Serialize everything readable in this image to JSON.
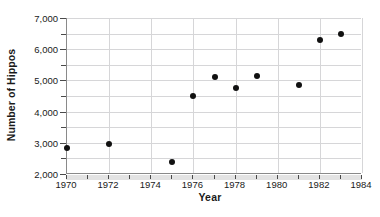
{
  "chart_data": {
    "type": "scatter",
    "title": "",
    "xlabel": "Year",
    "ylabel": "Number of Hippos",
    "xlim": [
      1970,
      1984
    ],
    "ylim": [
      2000,
      7000
    ],
    "grid": true,
    "legend": null,
    "x_tick_step": 1,
    "x_label_step": 2,
    "y_tick_step": 500,
    "y_label_step": 1000,
    "x_ticks": [
      1970,
      1971,
      1972,
      1973,
      1974,
      1975,
      1976,
      1977,
      1978,
      1979,
      1980,
      1981,
      1982,
      1983,
      1984
    ],
    "x_tick_labels": [
      "1970",
      "",
      "1972",
      "",
      "1974",
      "",
      "1976",
      "",
      "1978",
      "",
      "1980",
      "",
      "1982",
      "",
      "1984"
    ],
    "y_ticks": [
      2000,
      2500,
      3000,
      3500,
      4000,
      4500,
      5000,
      5500,
      6000,
      6500,
      7000
    ],
    "y_tick_labels": [
      "2,000",
      "",
      "3,000",
      "",
      "4,000",
      "",
      "5,000",
      "",
      "6,000",
      "",
      "7,000"
    ],
    "points": [
      {
        "x": 1970,
        "y": 2850
      },
      {
        "x": 1972,
        "y": 2950
      },
      {
        "x": 1975,
        "y": 2400
      },
      {
        "x": 1976,
        "y": 4500
      },
      {
        "x": 1977,
        "y": 5100
      },
      {
        "x": 1978,
        "y": 4750
      },
      {
        "x": 1979,
        "y": 5150
      },
      {
        "x": 1981,
        "y": 4850
      },
      {
        "x": 1982,
        "y": 6300
      },
      {
        "x": 1983,
        "y": 6500
      }
    ],
    "marker_color": "#111111",
    "grid_color": "#d6d6d8",
    "axis_color": "#8a8a8a"
  },
  "axes": {
    "x_title": "Year",
    "y_title": "Number of Hippos"
  },
  "caption": {
    "ghost_text": ""
  }
}
